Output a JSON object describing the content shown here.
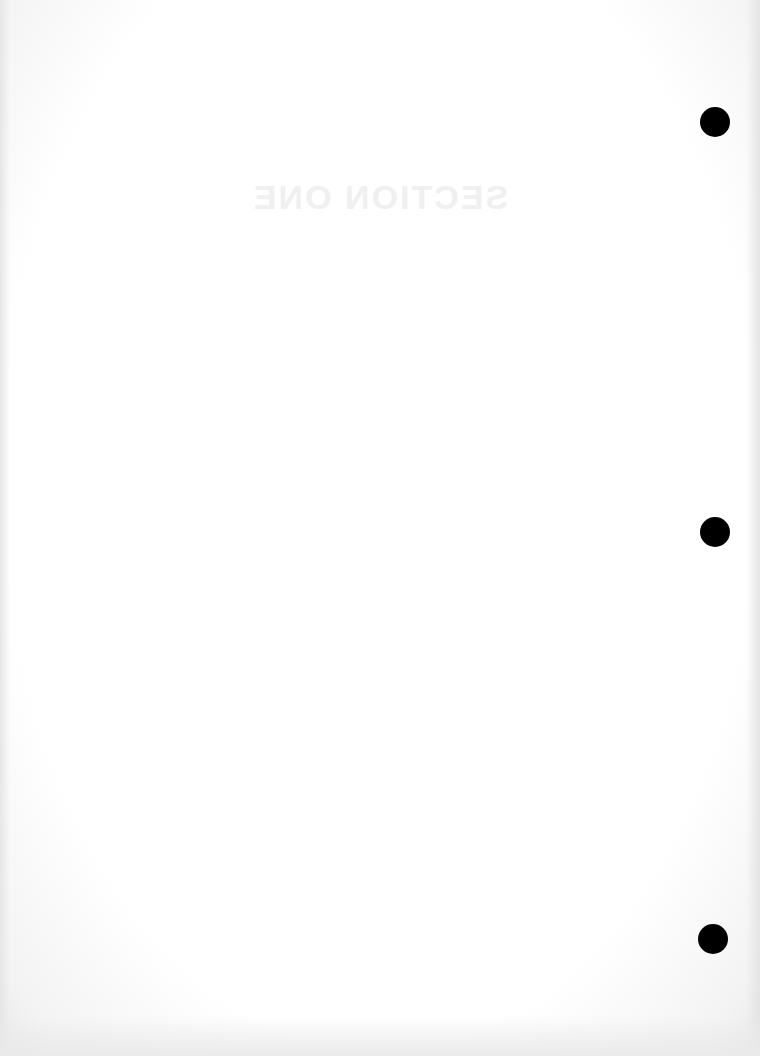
{
  "page": {
    "type": "blank loose-leaf sheet",
    "background_color": "#ffffff",
    "bleed_through": {
      "heading": "SECTION ONE",
      "subtitle": "",
      "mirrored": true,
      "legible": false
    },
    "punch_holes": [
      {
        "cx": 715,
        "cy": 122,
        "r": 15,
        "color": "#000000"
      },
      {
        "cx": 715,
        "cy": 532,
        "r": 15,
        "color": "#000000"
      },
      {
        "cx": 713,
        "cy": 939,
        "r": 15,
        "color": "#000000"
      }
    ]
  }
}
